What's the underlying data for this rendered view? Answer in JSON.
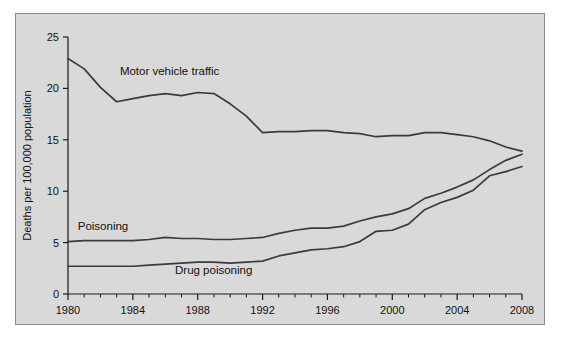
{
  "figure": {
    "background_color": "#d9d9d9",
    "border_color": "#8a8a8a",
    "line_color": "#3b3b3b"
  },
  "chart_data": {
    "type": "line",
    "title": "",
    "xlabel": "Year",
    "ylabel": "Deaths per 100,000 population",
    "xlim": [
      1980,
      2008
    ],
    "ylim": [
      0,
      25
    ],
    "yticks": [
      0,
      5,
      10,
      15,
      20,
      25
    ],
    "xticks": [
      1980,
      1984,
      1988,
      1992,
      1996,
      2000,
      2004,
      2008
    ],
    "xtick_labels": [
      "1980",
      "1984",
      "1988",
      "1992",
      "1996",
      "2000",
      "2004",
      "2008"
    ],
    "ytick_labels": [
      "0",
      "5",
      "10",
      "15",
      "20",
      "25"
    ],
    "minor_xtick_interval": 1,
    "grid": false,
    "legend": "inline-labels",
    "x": [
      1980,
      1981,
      1982,
      1983,
      1984,
      1985,
      1986,
      1987,
      1988,
      1989,
      1990,
      1991,
      1992,
      1993,
      1994,
      1995,
      1996,
      1997,
      1998,
      1999,
      2000,
      2001,
      2002,
      2003,
      2004,
      2005,
      2006,
      2007,
      2008
    ],
    "series": [
      {
        "name": "Motor vehicle traffic",
        "label_x": 1983.2,
        "label_y": 21.3,
        "values": [
          22.9,
          21.9,
          20.1,
          18.7,
          19.0,
          19.3,
          19.5,
          19.3,
          19.6,
          19.5,
          18.5,
          17.3,
          15.7,
          15.8,
          15.8,
          15.9,
          15.9,
          15.7,
          15.6,
          15.3,
          15.4,
          15.4,
          15.7,
          15.7,
          15.5,
          15.3,
          14.9,
          14.3,
          13.9
        ]
      },
      {
        "name": "Poisoning",
        "label_x": 1980.6,
        "label_y": 6.2,
        "values": [
          5.1,
          5.2,
          5.2,
          5.2,
          5.2,
          5.3,
          5.5,
          5.4,
          5.4,
          5.3,
          5.3,
          5.4,
          5.5,
          5.9,
          6.2,
          6.4,
          6.4,
          6.6,
          7.1,
          7.5,
          7.8,
          8.3,
          9.3,
          9.8,
          10.4,
          11.1,
          12.1,
          13.0,
          13.6
        ]
      },
      {
        "name": "Drug poisoning",
        "label_x": 1986.6,
        "label_y": 1.95,
        "values": [
          2.7,
          2.7,
          2.7,
          2.7,
          2.7,
          2.8,
          2.9,
          3.0,
          3.1,
          3.1,
          3.0,
          3.1,
          3.2,
          3.7,
          4.0,
          4.3,
          4.4,
          4.6,
          5.1,
          6.1,
          6.2,
          6.8,
          8.2,
          8.9,
          9.4,
          10.1,
          11.5,
          11.9,
          12.4
        ]
      }
    ]
  }
}
